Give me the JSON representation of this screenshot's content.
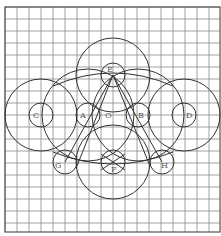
{
  "diagram": {
    "grid": {
      "x0": 5,
      "y0": 7,
      "x1": 220,
      "y1": 232,
      "step": 12,
      "color": "#8a8a8a",
      "border": "#555555"
    },
    "stroke": "#333333",
    "points": [
      {
        "id": "O",
        "label": "O",
        "x": 113,
        "y": 115,
        "lx": 105,
        "ly": 118
      },
      {
        "id": "E",
        "label": "E",
        "x": 113,
        "y": 75,
        "lx": 107,
        "ly": 72
      },
      {
        "id": "F",
        "label": "F",
        "x": 113,
        "y": 162,
        "lx": 111,
        "ly": 172
      },
      {
        "id": "A",
        "label": "A",
        "x": 88,
        "y": 115,
        "lx": 80,
        "ly": 118
      },
      {
        "id": "B",
        "label": "B",
        "x": 138,
        "y": 115,
        "lx": 138,
        "ly": 118
      },
      {
        "id": "C",
        "label": "C",
        "x": 41,
        "y": 115,
        "lx": 33,
        "ly": 118
      },
      {
        "id": "D",
        "label": "D",
        "x": 184,
        "y": 115,
        "lx": 186,
        "ly": 118
      },
      {
        "id": "G",
        "label": "G",
        "x": 65,
        "y": 162,
        "lx": 55,
        "ly": 168
      },
      {
        "id": "H",
        "label": "H",
        "x": 162,
        "y": 162,
        "lx": 161,
        "ly": 168
      }
    ],
    "circles": [
      {
        "name": "circle-E-large",
        "cx": 113,
        "cy": 75,
        "r": 37
      },
      {
        "name": "circle-E-small",
        "cx": 113,
        "cy": 75,
        "r": 12
      },
      {
        "name": "circle-F-large",
        "cx": 113,
        "cy": 162,
        "r": 37
      },
      {
        "name": "circle-F-small",
        "cx": 113,
        "cy": 162,
        "r": 12
      },
      {
        "name": "circle-C-large",
        "cx": 41,
        "cy": 115,
        "r": 36
      },
      {
        "name": "circle-C-small",
        "cx": 41,
        "cy": 115,
        "r": 12
      },
      {
        "name": "circle-D-large",
        "cx": 184,
        "cy": 115,
        "r": 36
      },
      {
        "name": "circle-D-small",
        "cx": 184,
        "cy": 115,
        "r": 12
      },
      {
        "name": "circle-A-large",
        "cx": 88,
        "cy": 115,
        "r": 46
      },
      {
        "name": "circle-A-small",
        "cx": 88,
        "cy": 115,
        "r": 12
      },
      {
        "name": "circle-B-large",
        "cx": 138,
        "cy": 115,
        "r": 46
      },
      {
        "name": "circle-B-small",
        "cx": 138,
        "cy": 115,
        "r": 12
      },
      {
        "name": "circle-G-small",
        "cx": 65,
        "cy": 162,
        "r": 12
      },
      {
        "name": "circle-H-small",
        "cx": 162,
        "cy": 162,
        "r": 12
      }
    ],
    "lines": [
      {
        "name": "line-E-G",
        "x1": 113,
        "y1": 75,
        "x2": 65,
        "y2": 162
      },
      {
        "name": "line-E-H",
        "x1": 113,
        "y1": 75,
        "x2": 162,
        "y2": 162
      },
      {
        "name": "line-E-left-inner",
        "x1": 113,
        "y1": 75,
        "x2": 77,
        "y2": 166
      },
      {
        "name": "line-E-right-inner",
        "x1": 113,
        "y1": 75,
        "x2": 150,
        "y2": 166
      },
      {
        "name": "line-F-left",
        "x1": 101,
        "y1": 154,
        "x2": 125,
        "y2": 170
      },
      {
        "name": "line-F-right",
        "x1": 125,
        "y1": 154,
        "x2": 101,
        "y2": 170
      }
    ],
    "arcs": [
      {
        "name": "arc-top-bridge",
        "d": "M 53 86 Q 113 60 173 86"
      },
      {
        "name": "arc-bottom-bridge",
        "d": "M 53 152 Q 113 176 173 152"
      }
    ]
  }
}
